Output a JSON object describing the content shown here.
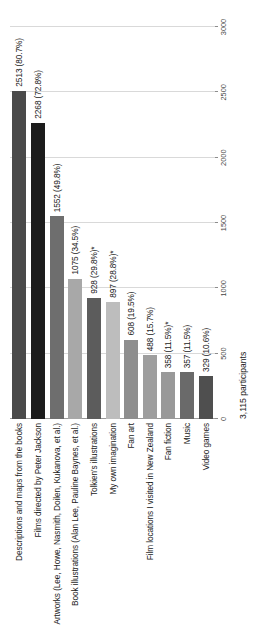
{
  "chart_data": {
    "type": "bar",
    "orientation": "horizontal",
    "title": "",
    "subtitle": "",
    "xlabel": "",
    "ylabel": "",
    "xlim": [
      0,
      3000
    ],
    "grid": true,
    "legend": "none",
    "categories": [
      "Descriptions and maps from the books",
      "Films directed by Peter Jackson",
      "Artworks (Lee, Howe, Nasmith, Doilen, Kukanova, et al.)",
      "Book illustrations (Alan Lee, Pauline Baynes, et al.)",
      "Tolkien's illustrations",
      "My own imagination",
      "Fan art",
      "Film locations I visited in New Zealand",
      "Fan fiction",
      "Music",
      "Video games"
    ],
    "values": [
      2513,
      2268,
      1552,
      1075,
      928,
      897,
      608,
      488,
      358,
      357,
      329
    ],
    "percents": [
      80.7,
      72.8,
      49.8,
      34.5,
      29.8,
      28.8,
      19.5,
      15.7,
      11.5,
      11.5,
      10.6
    ],
    "data_labels": [
      "2513 (80.7%)",
      "2268 (72.8%)",
      "1552 (49.8%)",
      "1075 (34.5%)",
      "928 (29.8%)*",
      "897 (28.8%)*",
      "608 (19.5%)",
      "488 (15.7%)",
      "358 (11.5%)*",
      "357 (11.5%)",
      "329 (10.6%)"
    ],
    "bar_colors": [
      "#4a4a4a",
      "#1c1c1c",
      "#6e6e6e",
      "#a8a8a8",
      "#5c5c5c",
      "#bdbdbd",
      "#8e8e8e",
      "#9e9e9e",
      "#999999",
      "#6a6a6a",
      "#4f4f4f"
    ],
    "xticks": [
      0,
      500,
      1000,
      1500,
      2000,
      2500,
      3000
    ],
    "xticklabels": [
      "0",
      "500",
      "1000",
      "1500",
      "2000",
      "2500",
      "3000"
    ]
  },
  "caption": {
    "participants": "3,115 participants"
  },
  "colors": {
    "grid": "#d9d9d9",
    "axis": "#9a9a9a",
    "text": "#1a1a1a",
    "tick_text": "#444444",
    "background": "#ffffff"
  }
}
